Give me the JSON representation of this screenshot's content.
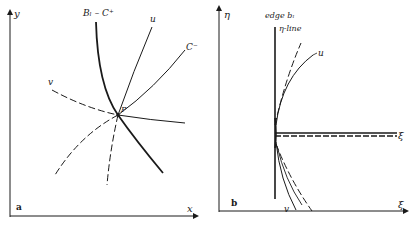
{
  "figure": {
    "panels": [
      {
        "id": "a",
        "panel_label": "a",
        "x_axis_label": "x",
        "y_axis_label": "y",
        "point_label": "P",
        "curves": [
          {
            "name": "B_l-C+",
            "label": "Bₗ – C⁺",
            "style": "thick solid"
          },
          {
            "name": "u",
            "label": "u",
            "style": "solid above P, dashed below P"
          },
          {
            "name": "C-",
            "label": "C⁻",
            "style": "solid above P, dashed below P"
          },
          {
            "name": "v",
            "label": "v",
            "style": "dashed left of P, solid right of P"
          }
        ]
      },
      {
        "id": "b",
        "panel_label": "b",
        "x_axis_label": "ξ",
        "y_axis_label": "η",
        "edge_label_line1": "edge bₗ",
        "edge_label_line2": "η-line",
        "xi_line_label": "ξ",
        "curves": [
          {
            "name": "u",
            "label": "u",
            "style": "solid with dashed companion"
          },
          {
            "name": "v",
            "label": "v",
            "style": "solid with dashed companion"
          },
          {
            "name": "xi-line",
            "label": "ξ",
            "style": "solid and dashed double line"
          }
        ]
      }
    ]
  },
  "colors": {
    "ink": "#1a1a1a",
    "background": "#ffffff"
  }
}
